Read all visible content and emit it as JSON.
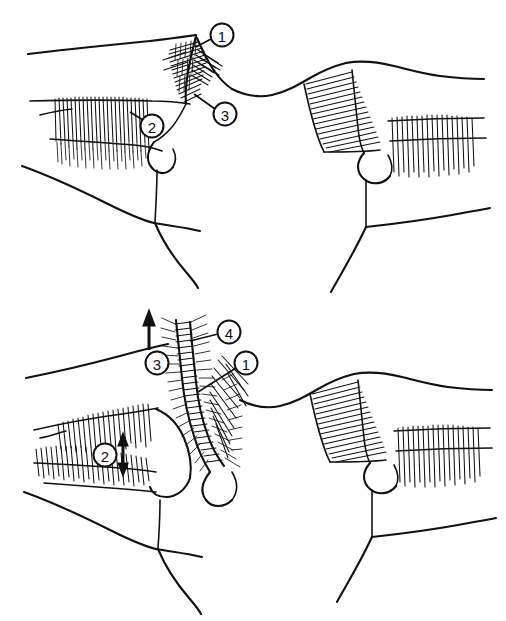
{
  "figure": {
    "background_color": "#ffffff",
    "ink_color": "#111111",
    "width": 506,
    "height": 621
  },
  "panels": [
    {
      "id": "upper",
      "name": "upper-panel",
      "label": "",
      "callouts": [
        {
          "number": "1",
          "cx": 222,
          "cy": 35,
          "r": 11.5,
          "leader": "M 211 39 L 196 47",
          "name": "callout-1-upper"
        },
        {
          "number": "3",
          "cx": 225,
          "cy": 114,
          "r": 11.5,
          "leader": "M 215 109 L 196 95",
          "name": "callout-3-upper"
        },
        {
          "number": "2",
          "cx": 152,
          "cy": 126,
          "r": 11.5,
          "leader": "M 143 120 L 131 112",
          "name": "callout-2-upper"
        }
      ],
      "arrows": []
    },
    {
      "id": "lower",
      "name": "lower-panel",
      "label": "",
      "callouts": [
        {
          "number": "4",
          "cx": 229,
          "cy": 332,
          "r": 11.5,
          "leader": "M 218 334 L 192 341",
          "name": "callout-4-lower"
        },
        {
          "number": "1",
          "cx": 246,
          "cy": 363,
          "r": 11.5,
          "leader": "M 236 367 L 196 391",
          "name": "callout-1-lower"
        },
        {
          "number": "3",
          "cx": 157,
          "cy": 363,
          "r": 11.5,
          "leader": "",
          "name": "callout-3-lower"
        },
        {
          "number": "2",
          "cx": 105,
          "cy": 455,
          "r": 11.5,
          "leader": "",
          "name": "callout-2-lower"
        }
      ],
      "arrows": [
        {
          "kind": "single-up",
          "name": "traction-arrow-up",
          "x": 149,
          "y_tail": 348,
          "y_head": 314,
          "linked_callout": "3"
        },
        {
          "kind": "double-vertical",
          "name": "displacement-arrow-double",
          "x": 123,
          "y_top": 435,
          "y_bottom": 474,
          "linked_callout": "2"
        }
      ]
    }
  ],
  "legend": {
    "items": [
      {
        "number": "1",
        "name": "marker-1"
      },
      {
        "number": "2",
        "name": "marker-2"
      },
      {
        "number": "3",
        "name": "marker-3"
      },
      {
        "number": "4",
        "name": "marker-4"
      }
    ]
  }
}
